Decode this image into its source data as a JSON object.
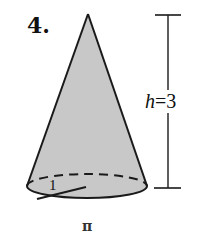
{
  "problem": {
    "number_label": "4.",
    "height_label_var": "h",
    "height_label_eq": "=",
    "height_label_value": "3",
    "radius_label": "1",
    "answer_label": "π"
  },
  "figure": {
    "shape": "cone",
    "height": 3,
    "radius": 1,
    "fill_color": "#c8c8c8",
    "stroke_color": "#1a1a1a"
  }
}
